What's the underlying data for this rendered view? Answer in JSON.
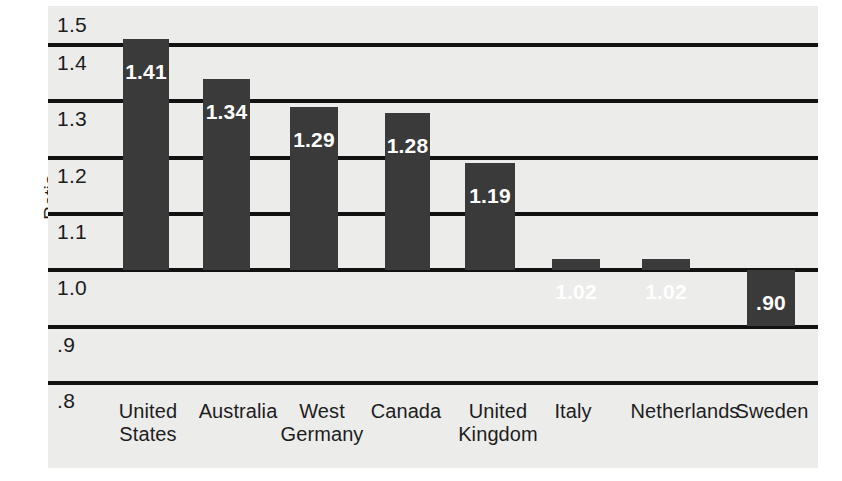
{
  "chart_data": {
    "type": "bar",
    "title": "",
    "xlabel": "",
    "ylabel": "Ratio",
    "ylim": [
      0.8,
      1.5
    ],
    "grid": true,
    "legend": "none",
    "categories": [
      "United States",
      "Australia",
      "West Germany",
      "Canada",
      "United Kingdom",
      "Italy",
      "Netherlands",
      "Sweden"
    ],
    "values": [
      1.41,
      1.34,
      1.29,
      1.28,
      1.19,
      1.02,
      1.02,
      0.9
    ],
    "value_labels": [
      "1.41",
      "1.34",
      "1.29",
      "1.28",
      "1.19",
      "1.02",
      "1.02",
      ".90"
    ],
    "ytick_labels": [
      "1.5",
      "1.4",
      "1.3",
      "1.2",
      "1.1",
      "1.0",
      ".9",
      ".8"
    ],
    "ytick_values": [
      1.5,
      1.4,
      1.3,
      1.2,
      1.1,
      1.0,
      0.9,
      0.8
    ],
    "bar_color": "#3a3a3a",
    "panel_color": "#ececeb",
    "gridline_color": "#121212",
    "value_label_color": "#ffffff"
  },
  "axis": {
    "y_title": "Ratio"
  },
  "categories_display": [
    "United\nStates",
    "Australia",
    "West\nGermany",
    "Canada",
    "United\nKingdom",
    "Italy",
    "Netherlands",
    "Sweden"
  ]
}
